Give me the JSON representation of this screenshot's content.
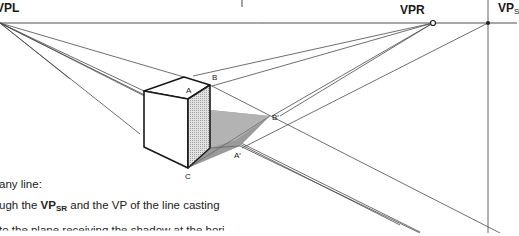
{
  "labels": {
    "vpl": "VPL",
    "vpr": "VPR",
    "vps_main": "VP",
    "vps_sub": "S",
    "point_a": "A",
    "point_b": "B",
    "point_c": "C",
    "point_a_prime": "A′",
    "point_b_prime": "B′"
  },
  "text": {
    "line1": "any line:",
    "line2_prefix": "ugh the ",
    "line2_bold": "VP",
    "line2_sub": "SR",
    "line2_suffix": " and the VP of the line casting",
    "line3": "to the plane receiving the shadow at the hori"
  },
  "colors": {
    "line": "#3a3a3a",
    "cube_edge": "#1a1a1a",
    "shaded_face": "#cfcfcf",
    "shadow": "#9a9a9a",
    "background": "#ffffff"
  }
}
